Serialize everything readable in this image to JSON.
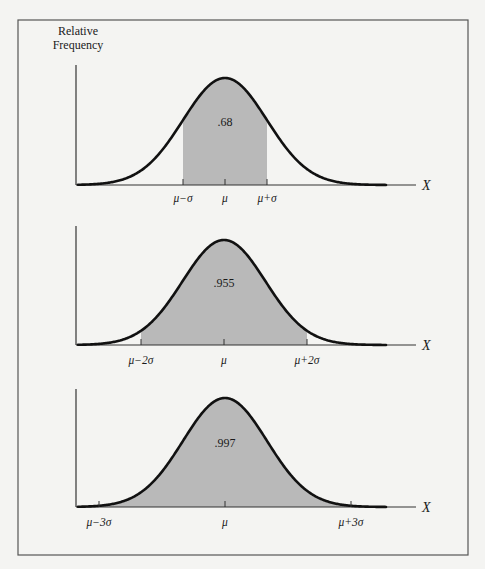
{
  "chart_data": {
    "type": "area",
    "ylabel": "Relative Frequency",
    "xlabel": "X",
    "grid": false,
    "legend": null,
    "colors": {
      "background": "#f4f4f2",
      "frame": "#555555",
      "curve": "#111111",
      "shade": "#b9b9b9",
      "axis": "#333333"
    },
    "panels": [
      {
        "id": "one-sigma",
        "shaded_range_sigma": [
          -1,
          1
        ],
        "area": 0.68,
        "area_label": ".68",
        "tick_labels": [
          "μ−σ",
          "μ",
          "μ+σ"
        ],
        "tick_positions_sigma": [
          -1,
          0,
          1
        ]
      },
      {
        "id": "two-sigma",
        "shaded_range_sigma": [
          -2,
          2
        ],
        "area": 0.955,
        "area_label": ".955",
        "tick_labels": [
          "μ−2σ",
          "μ",
          "μ+2σ"
        ],
        "tick_positions_sigma": [
          -2,
          0,
          2
        ]
      },
      {
        "id": "three-sigma",
        "shaded_range_sigma": [
          -3,
          3
        ],
        "area": 0.997,
        "area_label": ".997",
        "tick_labels": [
          "μ−3σ",
          "μ",
          "μ+3σ"
        ],
        "tick_positions_sigma": [
          -3,
          0,
          3
        ]
      }
    ]
  },
  "labels": {
    "ylabel_line1": "Relative",
    "ylabel_line2": "Frequency",
    "x_axis": "X"
  },
  "layout": {
    "frame": {
      "x": 18,
      "y": 20,
      "w": 450,
      "h": 535
    },
    "panels": [
      {
        "axisX": 76,
        "axisTop": 65,
        "baseY": 185,
        "axisEnd": 416,
        "mu": 225,
        "sigma": 42,
        "peakY": 78,
        "tickLabelY": 202,
        "xLabelY": 190
      },
      {
        "axisX": 76,
        "axisTop": 226,
        "baseY": 345,
        "axisEnd": 416,
        "mu": 224,
        "sigma": 41.5,
        "peakY": 240,
        "tickLabelY": 364,
        "xLabelY": 350
      },
      {
        "axisX": 76,
        "axisTop": 389,
        "baseY": 507,
        "axisEnd": 416,
        "mu": 225,
        "sigma": 42,
        "peakY": 398,
        "tickLabelY": 526,
        "xLabelY": 512
      }
    ]
  }
}
